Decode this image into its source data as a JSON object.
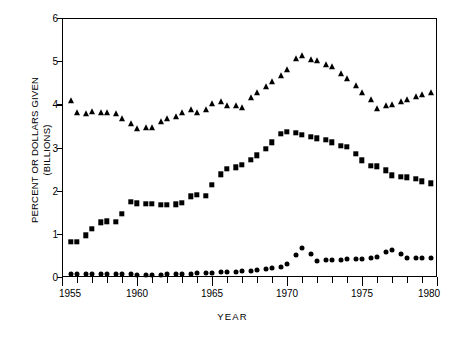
{
  "chart_data": {
    "type": "line",
    "title": "",
    "xlabel": "YEAR",
    "ylabel": "PERCENT OR DOLLARS GIVEN\n(BILLIONS)",
    "xlim": [
      1955,
      1980
    ],
    "ylim": [
      0,
      6
    ],
    "grid": false,
    "legend": "none",
    "x_ticklabels": [
      "1955",
      "1960",
      "1965",
      "1970",
      "1975",
      "1980"
    ],
    "x_tickvalues": [
      1955,
      1960,
      1965,
      1970,
      1975,
      1980
    ],
    "x_minor_tick_interval": 1,
    "y_ticklabels": [
      "0",
      "1",
      "2",
      "3",
      "4",
      "5",
      "6"
    ],
    "y_tickvalues": [
      0,
      1,
      2,
      3,
      4,
      5,
      6
    ],
    "x": [
      1955.6,
      1956.0,
      1956.6,
      1957.0,
      1957.6,
      1958.0,
      1958.6,
      1959.0,
      1959.6,
      1960.0,
      1960.6,
      1961.0,
      1961.6,
      1962.0,
      1962.6,
      1963.0,
      1963.6,
      1964.0,
      1964.6,
      1965.0,
      1965.6,
      1966.0,
      1966.6,
      1967.0,
      1967.6,
      1968.0,
      1968.6,
      1969.0,
      1969.6,
      1970.0,
      1970.6,
      1971.0,
      1971.6,
      1972.0,
      1972.6,
      1973.0,
      1973.6,
      1974.0,
      1974.6,
      1975.0,
      1975.6,
      1976.0,
      1976.6,
      1977.0,
      1977.6,
      1978.0,
      1978.6,
      1979.0,
      1979.6
    ],
    "series": [
      {
        "name": "triangles",
        "marker": "triangle",
        "color": "#000000",
        "values": [
          4.08,
          3.8,
          3.78,
          3.82,
          3.8,
          3.8,
          3.78,
          3.65,
          3.55,
          3.44,
          3.46,
          3.45,
          3.58,
          3.66,
          3.7,
          3.79,
          3.88,
          3.8,
          3.88,
          4.0,
          4.06,
          3.96,
          3.95,
          3.92,
          4.14,
          4.26,
          4.4,
          4.52,
          4.66,
          4.8,
          5.04,
          5.11,
          5.02,
          5.0,
          4.9,
          4.86,
          4.7,
          4.58,
          4.42,
          4.26,
          4.1,
          3.9,
          3.96,
          3.98,
          4.06,
          4.1,
          4.16,
          4.22,
          4.26
        ]
      },
      {
        "name": "squares",
        "marker": "square",
        "color": "#000000",
        "values": [
          0.81,
          0.81,
          0.97,
          1.11,
          1.27,
          1.29,
          1.28,
          1.46,
          1.74,
          1.71,
          1.7,
          1.7,
          1.67,
          1.67,
          1.68,
          1.72,
          1.87,
          1.91,
          1.88,
          2.14,
          2.38,
          2.5,
          2.54,
          2.6,
          2.72,
          2.82,
          2.97,
          3.12,
          3.32,
          3.36,
          3.34,
          3.3,
          3.25,
          3.21,
          3.18,
          3.12,
          3.04,
          3.02,
          2.86,
          2.7,
          2.58,
          2.56,
          2.47,
          2.36,
          2.32,
          2.31,
          2.28,
          2.22,
          2.17
        ]
      },
      {
        "name": "circles",
        "marker": "circle",
        "color": "#000000",
        "values": [
          0.07,
          0.07,
          0.06,
          0.06,
          0.06,
          0.06,
          0.06,
          0.06,
          0.06,
          0.05,
          0.05,
          0.05,
          0.05,
          0.06,
          0.06,
          0.07,
          0.08,
          0.09,
          0.1,
          0.1,
          0.11,
          0.11,
          0.12,
          0.13,
          0.14,
          0.16,
          0.18,
          0.2,
          0.23,
          0.31,
          0.52,
          0.68,
          0.54,
          0.37,
          0.39,
          0.4,
          0.4,
          0.41,
          0.41,
          0.42,
          0.43,
          0.46,
          0.57,
          0.62,
          0.53,
          0.45,
          0.45,
          0.45,
          0.45
        ]
      }
    ]
  }
}
